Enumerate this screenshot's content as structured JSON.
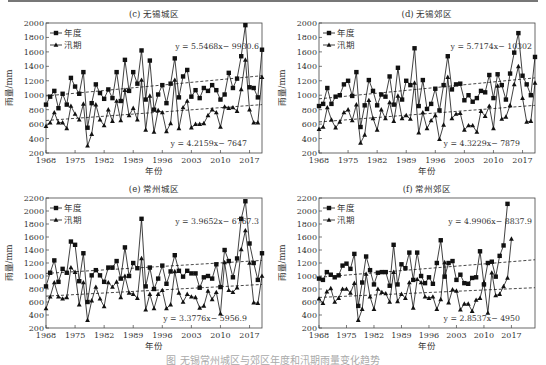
{
  "figure": {
    "caption": "图    无锡常州城区与郊区年度和汛期雨量变化趋势"
  },
  "chart_data": [
    {
      "id": "c",
      "type": "line",
      "title": "(c) 无锡城区",
      "xlabel": "年份",
      "ylabel": "雨量/mm",
      "xlim": [
        1968,
        2020
      ],
      "ylim": [
        200,
        2000
      ],
      "yticks": [
        200,
        400,
        600,
        800,
        1000,
        1200,
        1400,
        1600,
        1800,
        2000
      ],
      "xticks": [
        1968,
        1975,
        1982,
        1989,
        1996,
        2003,
        2010,
        2017
      ],
      "legend": [
        "年度",
        "汛期"
      ],
      "legend_position": "upper left",
      "grid": false,
      "x": [
        1968,
        1969,
        1970,
        1971,
        1972,
        1973,
        1974,
        1975,
        1976,
        1977,
        1978,
        1979,
        1980,
        1981,
        1982,
        1983,
        1984,
        1985,
        1986,
        1987,
        1988,
        1989,
        1990,
        1991,
        1992,
        1993,
        1994,
        1995,
        1996,
        1997,
        1998,
        1999,
        2000,
        2001,
        2002,
        2003,
        2004,
        2005,
        2006,
        2007,
        2008,
        2009,
        2010,
        2011,
        2012,
        2013,
        2014,
        2015,
        2016,
        2017,
        2018,
        2019,
        2020
      ],
      "series": [
        {
          "name": "年度",
          "marker": "square",
          "values": [
            870,
            980,
            1060,
            820,
            1020,
            870,
            1240,
            1120,
            1020,
            1320,
            550,
            890,
            1150,
            1030,
            950,
            1080,
            960,
            1320,
            920,
            1490,
            1060,
            1320,
            1160,
            1620,
            940,
            1480,
            800,
            1010,
            1140,
            890,
            1160,
            1510,
            970,
            1260,
            1350,
            980,
            1070,
            960,
            1100,
            1060,
            1140,
            1070,
            940,
            1010,
            1310,
            1100,
            1230,
            1540,
            1970,
            1110,
            1100,
            970,
            1630
          ]
        },
        {
          "name": "汛期",
          "marker": "triangle",
          "values": [
            570,
            620,
            760,
            620,
            620,
            540,
            850,
            740,
            660,
            880,
            300,
            460,
            870,
            660,
            580,
            800,
            640,
            920,
            650,
            1070,
            720,
            820,
            660,
            1210,
            520,
            990,
            490,
            790,
            760,
            500,
            610,
            1210,
            540,
            830,
            920,
            550,
            600,
            600,
            610,
            720,
            800,
            760,
            560,
            840,
            820,
            830,
            780,
            1080,
            1490,
            800,
            620,
            620,
            1250
          ]
        }
      ],
      "trendlines": [
        {
          "series": "年度",
          "equation": "y = 5.5468x− 9930.6",
          "label": "y = 5.5468x− 9930.6",
          "start": 990,
          "end": 1270
        },
        {
          "series": "汛期",
          "equation": "y = 4.2159x− 7647",
          "label": "y = 4.2159x− 7647",
          "start": 650,
          "end": 870
        }
      ]
    },
    {
      "id": "d",
      "type": "line",
      "title": "(d) 无锡郊区",
      "xlabel": "年份",
      "ylabel": "雨量/mm",
      "xlim": [
        1968,
        2020
      ],
      "ylim": [
        200,
        2000
      ],
      "yticks": [
        200,
        400,
        600,
        800,
        1000,
        1200,
        1400,
        1600,
        1800,
        2000
      ],
      "xticks": [
        1968,
        1975,
        1982,
        1989,
        1996,
        2003,
        2010,
        2017
      ],
      "legend": [
        "年度",
        "汛期"
      ],
      "legend_position": "upper left",
      "grid": false,
      "x": [
        1968,
        1969,
        1970,
        1971,
        1972,
        1973,
        1974,
        1975,
        1976,
        1977,
        1978,
        1979,
        1980,
        1981,
        1982,
        1983,
        1984,
        1985,
        1986,
        1987,
        1988,
        1989,
        1990,
        1991,
        1992,
        1993,
        1994,
        1995,
        1996,
        1997,
        1998,
        1999,
        2000,
        2001,
        2002,
        2003,
        2004,
        2005,
        2006,
        2007,
        2008,
        2009,
        2010,
        2011,
        2012,
        2013,
        2014,
        2015,
        2016,
        2017,
        2018,
        2019,
        2020
      ],
      "series": [
        {
          "name": "年度",
          "marker": "square",
          "values": [
            850,
            880,
            1100,
            880,
            980,
            1000,
            1150,
            1200,
            990,
            1320,
            560,
            860,
            1210,
            1060,
            860,
            1010,
            980,
            1260,
            870,
            1380,
            940,
            1200,
            1140,
            1650,
            850,
            1210,
            810,
            880,
            1090,
            790,
            1140,
            1540,
            1080,
            1150,
            1160,
            930,
            1000,
            910,
            960,
            1060,
            1040,
            1280,
            960,
            1290,
            1140,
            940,
            1300,
            1590,
            1860,
            1270,
            1150,
            1000,
            1530
          ]
        },
        {
          "name": "汛期",
          "marker": "triangle",
          "values": [
            530,
            560,
            830,
            660,
            550,
            630,
            760,
            800,
            650,
            870,
            340,
            450,
            930,
            680,
            520,
            800,
            680,
            900,
            640,
            990,
            680,
            720,
            670,
            1170,
            480,
            760,
            540,
            650,
            720,
            390,
            590,
            1250,
            680,
            740,
            750,
            520,
            580,
            580,
            490,
            780,
            710,
            850,
            540,
            1130,
            670,
            700,
            860,
            1150,
            1400,
            960,
            630,
            640,
            1170
          ]
        }
      ],
      "trendlines": [
        {
          "series": "年度",
          "equation": "y = 5.7174x− 10302",
          "label": "y = 5.7174x− 10302",
          "start": 950,
          "end": 1240
        },
        {
          "series": "汛期",
          "equation": "y = 4.3229x− 7879",
          "label": "y = 4.3229x− 7879",
          "start": 630,
          "end": 860
        }
      ]
    },
    {
      "id": "e",
      "type": "line",
      "title": "(e) 常州城区",
      "xlabel": "年份",
      "ylabel": "雨量/mm",
      "xlim": [
        1968,
        2020
      ],
      "ylim": [
        200,
        2200
      ],
      "yticks": [
        200,
        400,
        600,
        800,
        1000,
        1200,
        1400,
        1600,
        1800,
        2000,
        2200
      ],
      "xticks": [
        1968,
        1975,
        1982,
        1989,
        1996,
        2003,
        2010,
        2017
      ],
      "legend": [
        "年度",
        "汛期"
      ],
      "legend_position": "upper left",
      "grid": false,
      "x": [
        1968,
        1969,
        1970,
        1971,
        1972,
        1973,
        1974,
        1975,
        1976,
        1977,
        1978,
        1979,
        1980,
        1981,
        1982,
        1983,
        1984,
        1985,
        1986,
        1987,
        1988,
        1989,
        1990,
        1991,
        1992,
        1993,
        1994,
        1995,
        1996,
        1997,
        1998,
        1999,
        2000,
        2001,
        2002,
        2003,
        2004,
        2005,
        2006,
        2007,
        2008,
        2009,
        2010,
        2011,
        2012,
        2013,
        2014,
        2015,
        2016,
        2017,
        2018,
        2019,
        2020
      ],
      "series": [
        {
          "name": "年度",
          "marker": "square",
          "values": [
            840,
            1050,
            1240,
            910,
            1110,
            1050,
            1530,
            1480,
            920,
            1350,
            600,
            1010,
            1090,
            1010,
            910,
            1130,
            1130,
            1230,
            960,
            1440,
            1000,
            1200,
            1120,
            1880,
            840,
            1130,
            800,
            960,
            1160,
            880,
            1070,
            1320,
            1080,
            990,
            1080,
            1040,
            1040,
            820,
            980,
            1000,
            960,
            1180,
            830,
            1400,
            1230,
            980,
            1270,
            1880,
            2150,
            1500,
            1200,
            940,
            1350
          ]
        },
        {
          "name": "汛期",
          "marker": "triangle",
          "values": [
            500,
            680,
            900,
            680,
            650,
            670,
            1130,
            1060,
            560,
            900,
            320,
            620,
            830,
            650,
            530,
            900,
            830,
            910,
            670,
            1000,
            740,
            720,
            660,
            1270,
            480,
            720,
            500,
            720,
            780,
            500,
            560,
            1070,
            740,
            600,
            720,
            680,
            670,
            510,
            540,
            770,
            640,
            750,
            420,
            1210,
            780,
            750,
            820,
            1410,
            1700,
            1200,
            590,
            580,
            1000
          ]
        }
      ],
      "trendlines": [
        {
          "series": "年度",
          "equation": "y = 3.9652x− 6767.3",
          "label": "y = 3.9652x− 6767.3",
          "start": 1040,
          "end": 1240
        },
        {
          "series": "汛期",
          "equation": "y = 3.3776x− 5956.9",
          "label": "y = 3.3776x− 5956.9",
          "start": 690,
          "end": 870
        }
      ]
    },
    {
      "id": "f",
      "type": "line",
      "title": "(f) 常州郊区",
      "xlabel": "年份",
      "ylabel": "雨量/mm",
      "xlim": [
        1968,
        2023
      ],
      "ylim": [
        200,
        2200
      ],
      "yticks": [
        200,
        400,
        600,
        800,
        1000,
        1200,
        1400,
        1600,
        1800,
        2000,
        2200
      ],
      "xticks": [
        1968,
        1975,
        1982,
        1989,
        1996,
        2003,
        2010,
        2017
      ],
      "legend": [
        "年度",
        "汛期"
      ],
      "legend_position": "upper left",
      "grid": false,
      "x": [
        1968,
        1969,
        1970,
        1971,
        1972,
        1973,
        1974,
        1975,
        1976,
        1977,
        1978,
        1979,
        1980,
        1981,
        1982,
        1983,
        1984,
        1985,
        1986,
        1987,
        1988,
        1989,
        1990,
        1991,
        1992,
        1993,
        1994,
        1995,
        1996,
        1997,
        1998,
        1999,
        2000,
        2001,
        2002,
        2003,
        2004,
        2005,
        2006,
        2007,
        2008,
        2009,
        2010,
        2011,
        2012,
        2013,
        2014,
        2015,
        2016,
        2017
      ],
      "series": [
        {
          "name": "年度",
          "marker": "square",
          "values": [
            960,
            940,
            1060,
            1020,
            980,
            1010,
            1160,
            1190,
            1110,
            1340,
            540,
            900,
            1300,
            1090,
            870,
            1050,
            1060,
            1060,
            850,
            1480,
            870,
            1180,
            1120,
            1360,
            940,
            1360,
            1000,
            890,
            980,
            880,
            1200,
            1550,
            990,
            1200,
            1230,
            940,
            1020,
            890,
            880,
            970,
            980,
            1380,
            870,
            1200,
            1220,
            990,
            1310,
            1470,
            2110
          ]
        },
        {
          "name": "汛期",
          "marker": "triangle",
          "values": [
            650,
            580,
            760,
            810,
            600,
            660,
            800,
            800,
            740,
            890,
            320,
            490,
            1030,
            680,
            490,
            800,
            750,
            730,
            600,
            1060,
            610,
            720,
            660,
            900,
            510,
            950,
            900,
            680,
            660,
            680,
            490,
            640,
            1210,
            590,
            790,
            770,
            480,
            570,
            570,
            460,
            630,
            660,
            900,
            430,
            1050,
            700,
            720,
            840,
            970,
            1570
          ]
        }
      ],
      "trendlines": [
        {
          "series": "年度",
          "equation": "y = 4.9906x− 8837.9",
          "label": "y = 4.9906x− 8837.9",
          "start": 980,
          "end": 1250
        },
        {
          "series": "汛期",
          "equation": "y = 2.8537x− 4950",
          "label": "y = 2.8537x− 4950",
          "start": 670,
          "end": 820
        }
      ]
    }
  ]
}
